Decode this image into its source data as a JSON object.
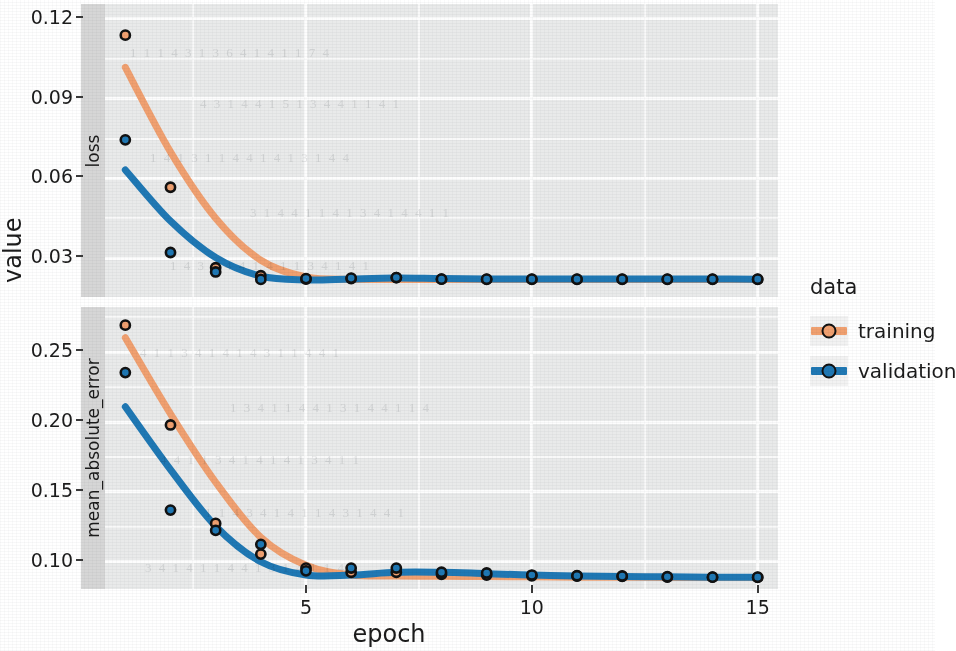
{
  "chart_data": {
    "type": "line",
    "title": "",
    "xlabel": "epoch",
    "ylabel": "value",
    "facets": [
      {
        "name": "loss",
        "ylim": [
          0.0155,
          0.1255
        ],
        "yticks": [
          0.12,
          0.09,
          0.06,
          0.03
        ],
        "ytick_labels": [
          "0.12",
          "0.09",
          "0.06",
          "0.03"
        ],
        "series": [
          {
            "name": "training",
            "color": "#F0A070",
            "x": [
              1,
              2,
              3,
              4,
              5,
              6,
              7,
              8,
              9,
              10,
              11,
              12,
              13,
              14,
              15
            ],
            "points": [
              0.1138,
              0.0567,
              0.0265,
              0.0235,
              0.0222,
              0.0224,
              0.0228,
              0.0222,
              0.0221,
              0.0221,
              0.0221,
              0.0221,
              0.0221,
              0.0221,
              0.0221
            ],
            "smooth": [
              0.1017,
              0.07,
              0.0451,
              0.0293,
              0.023,
              0.0221,
              0.0221,
              0.0221,
              0.0221,
              0.0221,
              0.0221,
              0.0221,
              0.0221,
              0.0221,
              0.0221
            ]
          },
          {
            "name": "validation",
            "color": "#1F78B4",
            "x": [
              1,
              2,
              3,
              4,
              5,
              6,
              7,
              8,
              9,
              10,
              11,
              12,
              13,
              14,
              15
            ],
            "points": [
              0.0745,
              0.0322,
              0.0249,
              0.0221,
              0.0224,
              0.0226,
              0.0228,
              0.0222,
              0.0222,
              0.0222,
              0.0222,
              0.0222,
              0.0222,
              0.0222,
              0.0222
            ],
            "smooth": [
              0.0632,
              0.044,
              0.0303,
              0.0233,
              0.0219,
              0.0223,
              0.0226,
              0.0224,
              0.0223,
              0.0223,
              0.0223,
              0.0223,
              0.0223,
              0.0223,
              0.0222
            ]
          }
        ]
      },
      {
        "name": "mean_absolute_error",
        "ylim": [
          0.0805,
          0.2825
        ],
        "yticks": [
          0.25,
          0.2,
          0.15,
          0.1
        ],
        "ytick_labels": [
          "0.25",
          "0.20",
          "0.15",
          "0.10"
        ],
        "series": [
          {
            "name": "training",
            "color": "#F0A070",
            "x": [
              1,
              2,
              3,
              4,
              5,
              6,
              7,
              8,
              9,
              10,
              11,
              12,
              13,
              14,
              15
            ],
            "points": [
              0.2695,
              0.198,
              0.1275,
              0.1055,
              0.0955,
              0.0925,
              0.0925,
              0.091,
              0.0905,
              0.09,
              0.0898,
              0.0895,
              0.089,
              0.089,
              0.0888
            ],
            "smooth": [
              0.2605,
              0.206,
              0.157,
              0.1175,
              0.0975,
              0.0905,
              0.0898,
              0.0896,
              0.0894,
              0.0892,
              0.089,
              0.0889,
              0.0888,
              0.0888,
              0.0888
            ]
          },
          {
            "name": "validation",
            "color": "#1F78B4",
            "x": [
              1,
              2,
              3,
              4,
              5,
              6,
              7,
              8,
              9,
              10,
              11,
              12,
              13,
              14,
              15
            ],
            "points": [
              0.2355,
              0.137,
              0.1225,
              0.1125,
              0.0935,
              0.0955,
              0.0955,
              0.0925,
              0.092,
              0.0905,
              0.09,
              0.0898,
              0.0893,
              0.089,
              0.089
            ],
            "smooth": [
              0.211,
              0.166,
              0.1255,
              0.1,
              0.0905,
              0.0905,
              0.0925,
              0.0925,
              0.0915,
              0.0905,
              0.0898,
              0.0895,
              0.0892,
              0.089,
              0.089
            ]
          }
        ]
      }
    ],
    "x": {
      "lim": [
        0.55,
        15.45
      ],
      "ticks": [
        5,
        10,
        15
      ],
      "tick_labels": [
        "5",
        "10",
        "15"
      ],
      "minor_ticks": [
        2.5,
        7.5,
        12.5
      ]
    },
    "grid": true,
    "legend": {
      "position": "right",
      "title": "data",
      "entries": [
        {
          "label": "training",
          "color": "#F0A070"
        },
        {
          "label": "validation",
          "color": "#1F78B4"
        }
      ]
    },
    "point_outline_color": "#111111",
    "panel_background": "#E9EAEA",
    "grid_color": "#FDFDFD",
    "strip_background": "#D6D6D6"
  },
  "ghost_marks": [
    {
      "text": "1 1 1 4 3 1 3 6 4 1 4 1 1 7 4",
      "x": 130,
      "y": 45
    },
    {
      "text": "4 3 1 4 4 1 5 1 3 4 4 1 1 4 1",
      "x": 200,
      "y": 96
    },
    {
      "text": "1 4 1 3 1 1 4 4 1 4 1 3 1 4 4",
      "x": 150,
      "y": 150
    },
    {
      "text": "3 1 4 4 1 1 4 1 3 4 1 4 4 1 1",
      "x": 250,
      "y": 205
    },
    {
      "text": "1 4 3 1 4 4 1 4 1 1 3 4 1 4 1",
      "x": 170,
      "y": 258
    },
    {
      "text": "4 1 1 3 4 1 4 1 4 3 1 1 4 4 1",
      "x": 140,
      "y": 345
    },
    {
      "text": "1 3 4 1 1 4 4 1 3 1 4 4 1 1 4",
      "x": 230,
      "y": 400
    },
    {
      "text": "4 4 1 1 3 4 1 4 1 4 1 3 4 1 1",
      "x": 160,
      "y": 452
    },
    {
      "text": "1 1 4 3 4 1 4 1 1 4 3 1 4 4 1",
      "x": 205,
      "y": 505
    },
    {
      "text": "3 4 1 4 1 1 4 4 1 3 1 4 1 1 4",
      "x": 145,
      "y": 560
    }
  ]
}
